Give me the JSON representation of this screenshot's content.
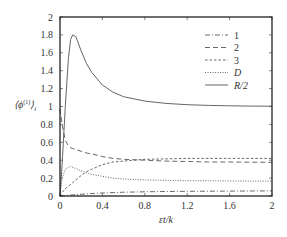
{
  "chart_data": {
    "type": "line",
    "title": "",
    "xlabel": "εt/k",
    "ylabel": "⟨ϕ⁽¹⁾⟩ᵢ",
    "xlim": [
      0,
      2
    ],
    "ylim": [
      0,
      2
    ],
    "xticks": [
      "0",
      "0.4",
      "0.8",
      "1.2",
      "1.6",
      "2"
    ],
    "yticks": [
      "0",
      "0.2",
      "0.4",
      "0.6",
      "0.8",
      "1",
      "1.2",
      "1.4",
      "1.6",
      "1.8",
      "2"
    ],
    "grid": false,
    "legend_position": "upper right",
    "x": [
      0,
      0.02,
      0.05,
      0.08,
      0.1,
      0.12,
      0.15,
      0.2,
      0.25,
      0.3,
      0.4,
      0.5,
      0.6,
      0.8,
      1.0,
      1.2,
      1.4,
      1.6,
      1.8,
      2.0
    ],
    "series": [
      {
        "name": "1",
        "style": "dash-dot",
        "values": [
          0,
          0.002,
          0.005,
          0.008,
          0.01,
          0.012,
          0.015,
          0.02,
          0.024,
          0.028,
          0.034,
          0.038,
          0.042,
          0.047,
          0.05,
          0.052,
          0.054,
          0.055,
          0.056,
          0.057
        ]
      },
      {
        "name": "2",
        "style": "long-dash",
        "values": [
          0.97,
          0.8,
          0.62,
          0.56,
          0.54,
          0.53,
          0.52,
          0.5,
          0.48,
          0.47,
          0.44,
          0.42,
          0.41,
          0.4,
          0.39,
          0.385,
          0.38,
          0.38,
          0.378,
          0.377
        ]
      },
      {
        "name": "3",
        "style": "short-dash",
        "values": [
          0,
          0.04,
          0.08,
          0.11,
          0.13,
          0.15,
          0.18,
          0.23,
          0.27,
          0.3,
          0.35,
          0.38,
          0.39,
          0.41,
          0.415,
          0.42,
          0.42,
          0.42,
          0.42,
          0.42
        ]
      },
      {
        "name": "D",
        "style": "dotted",
        "values": [
          0,
          0.2,
          0.3,
          0.32,
          0.33,
          0.32,
          0.31,
          0.28,
          0.26,
          0.24,
          0.22,
          0.2,
          0.19,
          0.18,
          0.175,
          0.17,
          0.17,
          0.168,
          0.167,
          0.166
        ]
      },
      {
        "name": "R/2",
        "style": "solid",
        "values": [
          0,
          0.35,
          1.0,
          1.55,
          1.75,
          1.8,
          1.78,
          1.62,
          1.48,
          1.38,
          1.24,
          1.16,
          1.11,
          1.06,
          1.035,
          1.02,
          1.012,
          1.008,
          1.005,
          1.003
        ]
      }
    ]
  },
  "legend": {
    "items": [
      {
        "label": "1",
        "italic": false
      },
      {
        "label": "2",
        "italic": false
      },
      {
        "label": "3",
        "italic": false
      },
      {
        "label": "D",
        "italic": true
      },
      {
        "label": "R/2",
        "italic": true
      }
    ]
  },
  "axes": {
    "xlabel": "εt/k",
    "ylabel_main": "⟨ϕ",
    "ylabel_sup": "(1)",
    "ylabel_close": "⟩",
    "ylabel_sub": "i"
  },
  "colors": {
    "line": "#555555",
    "frame": "#222222"
  }
}
